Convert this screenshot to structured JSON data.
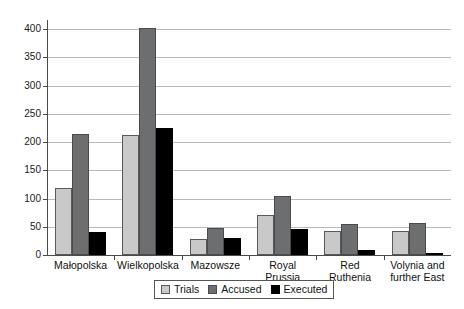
{
  "chart_data": {
    "type": "bar",
    "title": "",
    "subtitle": "",
    "xlabel": "",
    "ylabel": "",
    "ylim": [
      0,
      420
    ],
    "yticks": [
      0,
      50,
      100,
      150,
      200,
      250,
      300,
      350,
      400
    ],
    "ytick_labels": [
      "0",
      "50",
      "100",
      "150",
      "200",
      "250",
      "300",
      "350",
      "400"
    ],
    "grid": "horizontal",
    "legend_position": "bottom-center",
    "categories": [
      "Małopolska",
      "Wielkopolska",
      "Mazowsze",
      "Royal Prussia",
      "Red Ruthenia",
      "Volynia and further East"
    ],
    "category_lines": [
      [
        "Małopolska"
      ],
      [
        "Wielkopolska"
      ],
      [
        "Mazowsze"
      ],
      [
        "Royal",
        "Prussia"
      ],
      [
        "Red",
        "Ruthenia"
      ],
      [
        "Volynia and",
        "further East"
      ]
    ],
    "series": [
      {
        "name": "Trials",
        "color": "#c9c9c9",
        "values": [
          118,
          213,
          29,
          70,
          42,
          43
        ]
      },
      {
        "name": "Accused",
        "color": "#6d6e70",
        "values": [
          215,
          401,
          47,
          105,
          55,
          57
        ]
      },
      {
        "name": "Executed",
        "color": "#000000",
        "values": [
          40,
          225,
          31,
          46,
          8,
          3
        ]
      }
    ]
  },
  "legend": {
    "items": [
      {
        "label": "Trials"
      },
      {
        "label": "Accused"
      },
      {
        "label": "Executed"
      }
    ]
  },
  "axis": {
    "y_labels": [
      "400",
      "350",
      "300",
      "250",
      "200",
      "150",
      "100",
      "50",
      "0"
    ]
  }
}
